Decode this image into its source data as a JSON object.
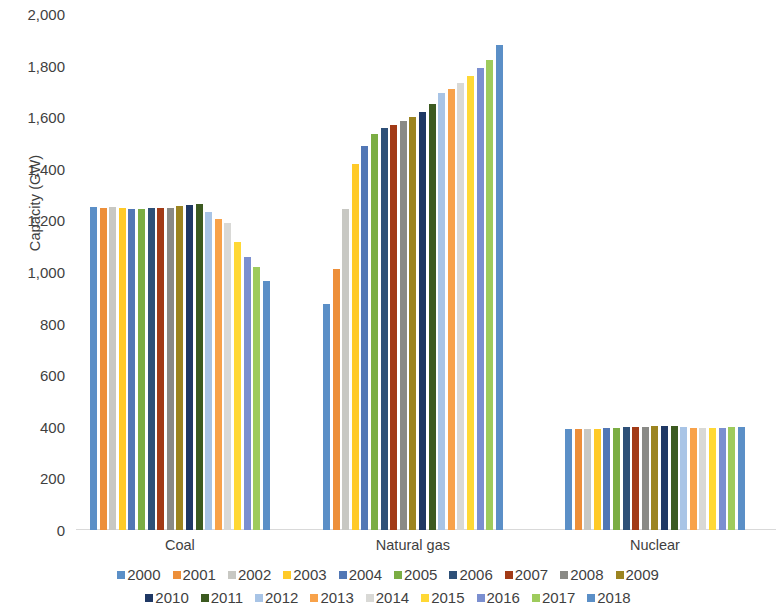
{
  "chart_data": {
    "type": "bar",
    "title": "",
    "subtitle": "",
    "xlabel": "",
    "ylabel": "Capacity (GW)",
    "ylim": [
      0,
      2000
    ],
    "ytick_step": 200,
    "ytick_labels": [
      "2,000",
      "1,800",
      "1,600",
      "1,400",
      "1,200",
      "1,000",
      "800",
      "600",
      "400",
      "200",
      "0"
    ],
    "ytick_values": [
      2000,
      1800,
      1600,
      1400,
      1200,
      1000,
      800,
      600,
      400,
      200,
      0
    ],
    "grid": false,
    "legend_position": "bottom",
    "categories": [
      "Coal",
      "Natural gas",
      "Nuclear"
    ],
    "series": [
      {
        "name": "2000",
        "color": "#5b8fc7",
        "values": [
          1252,
          875,
          390
        ]
      },
      {
        "name": "2001",
        "color": "#ed8f3a",
        "values": [
          1250,
          1010,
          391
        ]
      },
      {
        "name": "2002",
        "color": "#c8c8c3",
        "values": [
          1251,
          1245,
          392
        ]
      },
      {
        "name": "2003",
        "color": "#ffca28",
        "values": [
          1250,
          1420,
          393
        ]
      },
      {
        "name": "2004",
        "color": "#5277b5",
        "values": [
          1246,
          1487,
          395
        ]
      },
      {
        "name": "2005",
        "color": "#7bad43",
        "values": [
          1246,
          1535,
          396
        ]
      },
      {
        "name": "2006",
        "color": "#2e5078",
        "values": [
          1248,
          1557,
          399
        ]
      },
      {
        "name": "2007",
        "color": "#a23a16",
        "values": [
          1248,
          1570,
          400
        ]
      },
      {
        "name": "2008",
        "color": "#8a8a86",
        "values": [
          1250,
          1586,
          401
        ]
      },
      {
        "name": "2009",
        "color": "#9c8420",
        "values": [
          1256,
          1600,
          402
        ]
      },
      {
        "name": "2010",
        "color": "#1f3864",
        "values": [
          1260,
          1621,
          403
        ]
      },
      {
        "name": "2011",
        "color": "#3c5a20",
        "values": [
          1262,
          1650,
          402
        ]
      },
      {
        "name": "2012",
        "color": "#a8c4e6",
        "values": [
          1234,
          1692,
          398
        ]
      },
      {
        "name": "2013",
        "color": "#f8a24a",
        "values": [
          1205,
          1710,
          396
        ]
      },
      {
        "name": "2014",
        "color": "#d9d9d6",
        "values": [
          1190,
          1732,
          395
        ]
      },
      {
        "name": "2015",
        "color": "#ffd835",
        "values": [
          1115,
          1760,
          396
        ]
      },
      {
        "name": "2016",
        "color": "#7b8fd0",
        "values": [
          1060,
          1791,
          397
        ]
      },
      {
        "name": "2017",
        "color": "#9ecb5c",
        "values": [
          1020,
          1820,
          398
        ]
      },
      {
        "name": "2018",
        "color": "#5b8fc7",
        "values": [
          966,
          1880,
          399
        ]
      }
    ],
    "legend_rows": [
      [
        "2000",
        "2001",
        "2002",
        "2003",
        "2004",
        "2005",
        "2006",
        "2007",
        "2008",
        "2009"
      ],
      [
        "2010",
        "2011",
        "2012",
        "2013",
        "2014",
        "2015",
        "2016",
        "2017",
        "2018"
      ]
    ]
  }
}
